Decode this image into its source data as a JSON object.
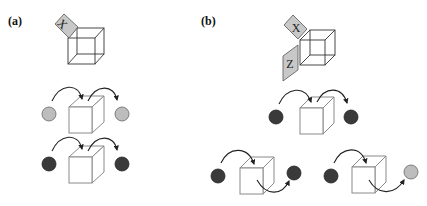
{
  "figure": {
    "panels": [
      {
        "id": "a",
        "label": "(a)",
        "top_cube": {
          "tiles": [
            {
              "letter": "X",
              "position": "top-left-corner"
            }
          ]
        },
        "rows": [
          {
            "input_ball": "light-gray",
            "output_ball": "light-gray",
            "path": "over-top"
          },
          {
            "input_ball": "dark-gray",
            "output_ball": "dark-gray",
            "path": "over-top"
          }
        ]
      },
      {
        "id": "b",
        "label": "(b)",
        "top_cube": {
          "tiles": [
            {
              "letter": "X",
              "position": "top-left-corner"
            },
            {
              "letter": "Z",
              "position": "left-face"
            }
          ]
        },
        "rows": [
          {
            "input_ball": "dark-gray",
            "output_ball": "dark-gray",
            "path": "over-top"
          },
          {
            "input_ball": "dark-gray",
            "output_ball": "dark-gray",
            "path": "through-bottom"
          },
          {
            "input_ball": "dark-gray",
            "output_ball": "light-gray",
            "path": "through-bottom"
          }
        ]
      }
    ],
    "colors": {
      "tile_fill": "#c8c8c8",
      "ball_light": "#bdbdbd",
      "ball_dark": "#3a3a3a",
      "box_stroke": "#8a8a8a",
      "wire_stroke": "#333333"
    }
  }
}
